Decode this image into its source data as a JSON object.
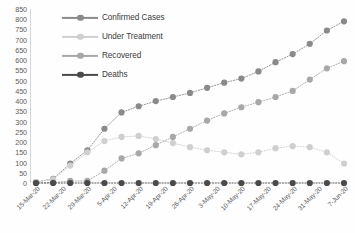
{
  "chart_data": {
    "type": "line",
    "title": "",
    "xlabel": "",
    "ylabel": "",
    "ylim": [
      0,
      850
    ],
    "ytick_step": 50,
    "yticks": [
      0,
      50,
      100,
      150,
      200,
      250,
      300,
      350,
      400,
      450,
      500,
      550,
      600,
      650,
      700,
      750,
      800,
      850
    ],
    "grid": false,
    "legend_position": "top-left",
    "marker": "circle",
    "linestyle": "dotted",
    "x_tick_labels": [
      "15-Mar-20",
      "22-Mar-20",
      "29-Mar-20",
      "5-Apr-20",
      "12-Apr-20",
      "19-Apr-20",
      "26-Apr-20",
      "3-May-20",
      "10-May-20",
      "17-May-20",
      "24-May-20",
      "31-May-20",
      "7-Jun-20"
    ],
    "x": [
      "15-Mar-20",
      "20-Mar-20",
      "25-Mar-20",
      "29-Mar-20",
      "3-Apr-20",
      "8-Apr-20",
      "12-Apr-20",
      "17-Apr-20",
      "22-Apr-20",
      "26-Apr-20",
      "1-May-20",
      "6-May-20",
      "10-May-20",
      "15-May-20",
      "20-May-20",
      "24-May-20",
      "29-May-20",
      "3-Jun-20",
      "7-Jun-20"
    ],
    "series": [
      {
        "name": "Confirmed Cases",
        "color": "#8a8a8a",
        "values": [
          5,
          20,
          95,
          160,
          265,
          345,
          375,
          400,
          420,
          440,
          465,
          490,
          510,
          545,
          590,
          630,
          680,
          745,
          790
        ]
      },
      {
        "name": "Under Treatment",
        "color": "#cfcfcf",
        "values": [
          5,
          18,
          85,
          150,
          205,
          225,
          230,
          215,
          195,
          175,
          160,
          150,
          140,
          150,
          170,
          180,
          175,
          150,
          95
        ]
      },
      {
        "name": "Recovered",
        "color": "#a8a8a8",
        "values": [
          0,
          2,
          10,
          10,
          60,
          120,
          145,
          185,
          225,
          265,
          305,
          340,
          370,
          395,
          420,
          450,
          505,
          560,
          595
        ]
      },
      {
        "name": "Deaths",
        "color": "#4a4a4a",
        "values": [
          0,
          0,
          0,
          0,
          0,
          0,
          0,
          0,
          0,
          0,
          0,
          0,
          0,
          0,
          0,
          0,
          0,
          0,
          0
        ]
      }
    ]
  },
  "legend": {
    "items": [
      {
        "label": "Confirmed Cases",
        "color": "#8a8a8a"
      },
      {
        "label": "Under Treatment",
        "color": "#cfcfcf"
      },
      {
        "label": "Recovered",
        "color": "#a8a8a8"
      },
      {
        "label": "Deaths",
        "color": "#4a4a4a"
      }
    ]
  }
}
